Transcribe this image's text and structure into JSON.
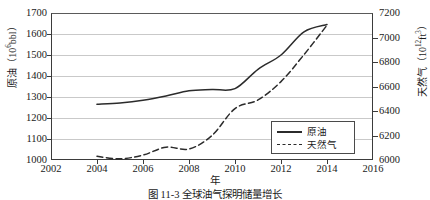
{
  "figure": {
    "caption": "图 11-3  全球油气探明储量增长"
  },
  "chart_data": {
    "type": "line",
    "title": "",
    "xlabel": "年",
    "ylabel": "原油（10⁶bbl）",
    "y2label": "天然气（10¹²ft³）",
    "xlim": [
      2002,
      2016
    ],
    "ylim": [
      1000,
      1700
    ],
    "y2lim": [
      6000,
      7200
    ],
    "xticks": [
      2002,
      2004,
      2006,
      2008,
      2010,
      2012,
      2014,
      2016
    ],
    "yticks": [
      1000,
      1100,
      1200,
      1300,
      1400,
      1500,
      1600,
      1700
    ],
    "y2ticks": [
      6000,
      6200,
      6400,
      6600,
      6800,
      7000,
      7200
    ],
    "grid": true,
    "legend_position": "lower-right",
    "series": [
      {
        "name": "原油",
        "axis": "left",
        "style": "solid",
        "x": [
          2004,
          2005,
          2006,
          2007,
          2008,
          2009,
          2010,
          2011,
          2012,
          2013,
          2014
        ],
        "values": [
          1265,
          1272,
          1285,
          1305,
          1330,
          1336,
          1340,
          1432,
          1500,
          1610,
          1645
        ]
      },
      {
        "name": "天然气",
        "axis": "right",
        "style": "dashed",
        "x": [
          2004,
          2005,
          2006,
          2007,
          2008,
          2009,
          2010,
          2011,
          2012,
          2013,
          2014
        ],
        "values": [
          6030,
          6010,
          6040,
          6105,
          6090,
          6200,
          6420,
          6490,
          6640,
          6860,
          7100
        ]
      }
    ]
  },
  "axes": {
    "left": {
      "label_main": "原油（10",
      "label_sup": "6",
      "label_tail": "bbl）",
      "ticks": [
        "1700",
        "1600",
        "1500",
        "1400",
        "1300",
        "1200",
        "1100",
        "1000"
      ]
    },
    "right": {
      "label_main": "天然气（10",
      "label_sup": "12",
      "label_tail": "ft",
      "label_sup2": "3",
      "label_tail2": "）",
      "ticks": [
        "7200",
        "7000",
        "6800",
        "6600",
        "6400",
        "6200",
        "6000"
      ]
    },
    "x": {
      "label": "年",
      "ticks": [
        "2002",
        "2004",
        "2006",
        "2008",
        "2010",
        "2012",
        "2014",
        "2016"
      ]
    }
  },
  "legend": {
    "items": [
      {
        "label": "原油",
        "style": "solid"
      },
      {
        "label": "天然气",
        "style": "dashed"
      }
    ]
  },
  "colors": {
    "axis": "#3b3b3b",
    "grid": "#c9c9c9",
    "series": "#2b2b2b",
    "background": "#ffffff"
  }
}
